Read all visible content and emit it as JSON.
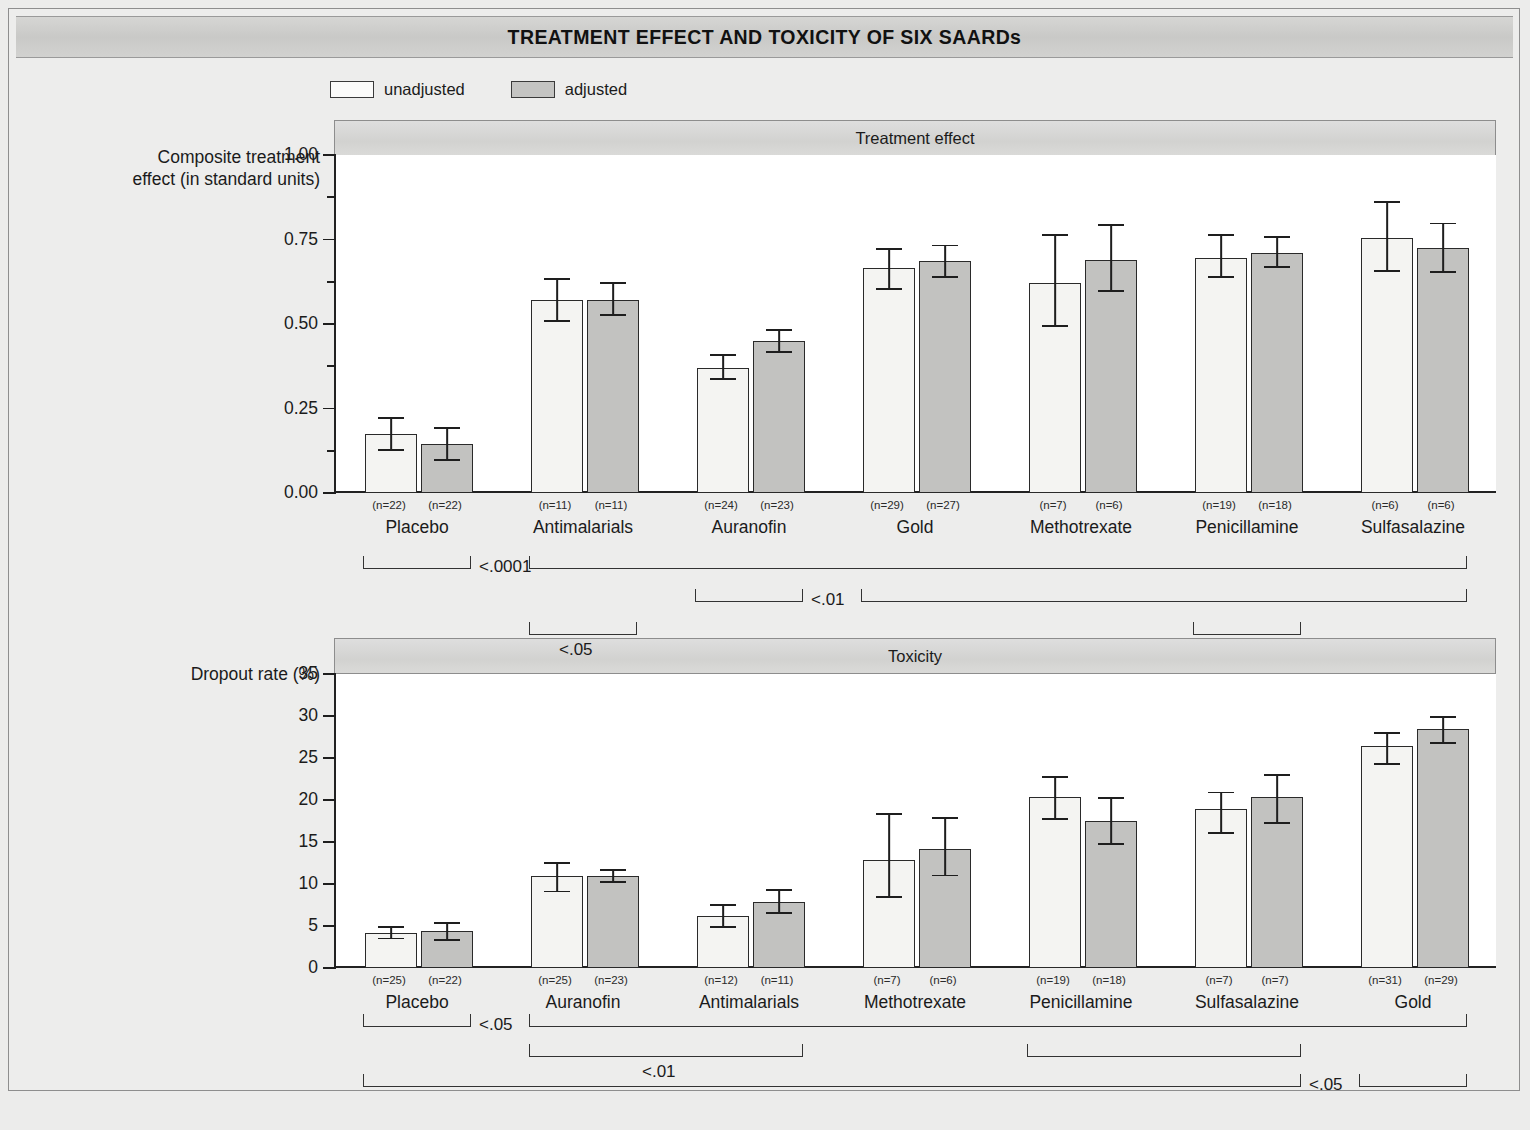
{
  "figure": {
    "title": "TREATMENT EFFECT AND TOXICITY OF SIX SAARDs",
    "caption": ""
  },
  "legend": {
    "items": [
      {
        "label": "unadjusted",
        "swatch": "white-bar-swatch",
        "color": "#f4f4f2"
      },
      {
        "label": "adjusted",
        "swatch": "gray-bar-swatch",
        "color": "#c2c2c0"
      }
    ]
  },
  "chart_data": [
    {
      "type": "bar",
      "id": "treatment-effect",
      "title": "Treatment effect",
      "ylabel": "Composite treatment effect (in standard units)",
      "xlabel": "",
      "ylim": [
        0.0,
        1.0
      ],
      "ytick_labels": [
        "0.00",
        "0.25",
        "0.50",
        "0.75",
        "1.00"
      ],
      "ytick_values": [
        0.0,
        0.25,
        0.5,
        0.75,
        1.0
      ],
      "yminor_values": [
        0.125,
        0.375,
        0.625,
        0.875
      ],
      "grid": false,
      "legend_position": "above-plot-left",
      "categories": [
        "Placebo",
        "Antimalarials",
        "Auranofin",
        "Gold",
        "Methotrexate",
        "Penicillamine",
        "Sulfasalazine"
      ],
      "series": [
        {
          "name": "unadjusted",
          "values": [
            0.175,
            0.57,
            0.37,
            0.665,
            0.62,
            0.695,
            0.755
          ],
          "err_low": [
            0.125,
            0.505,
            0.335,
            0.6,
            0.49,
            0.635,
            0.655
          ],
          "err_high": [
            0.225,
            0.635,
            0.41,
            0.725,
            0.765,
            0.765,
            0.865
          ],
          "n": [
            "(n=22)",
            "(n=11)",
            "(n=24)",
            "(n=29)",
            "(n=7)",
            "(n=19)",
            "(n=6)"
          ]
        },
        {
          "name": "adjusted",
          "values": [
            0.145,
            0.57,
            0.45,
            0.685,
            0.69,
            0.71,
            0.725
          ],
          "err_low": [
            0.095,
            0.525,
            0.415,
            0.635,
            0.595,
            0.665,
            0.65
          ],
          "err_high": [
            0.195,
            0.625,
            0.485,
            0.735,
            0.795,
            0.76,
            0.8
          ],
          "n": [
            "(n=22)",
            "(n=11)",
            "(n=23)",
            "(n=27)",
            "(n=6)",
            "(n=18)",
            "(n=6)"
          ]
        }
      ],
      "significance": [
        {
          "p": "<.0001",
          "from": "Placebo",
          "to": "Placebo",
          "row": 0,
          "label_side": "right"
        },
        {
          "p": "",
          "from": "Antimalarials",
          "to": "Sulfasalazine",
          "row": 0,
          "label_side": "none"
        },
        {
          "p": "<.01",
          "from": "Auranofin",
          "to": "Auranofin",
          "row": 1,
          "label_side": "right"
        },
        {
          "p": "",
          "from": "Gold",
          "to": "Sulfasalazine",
          "row": 1,
          "label_side": "none"
        },
        {
          "p": "<.05",
          "from": "Antimalarials",
          "to": "Antimalarials",
          "row": 2,
          "label_side": "none"
        },
        {
          "p": "",
          "from": "Penicillamine",
          "to": "Penicillamine",
          "row": 2,
          "label_side": "none"
        }
      ]
    },
    {
      "type": "bar",
      "id": "toxicity",
      "title": "Toxicity",
      "ylabel": "Dropout rate (%)",
      "xlabel": "",
      "ylim": [
        0,
        35
      ],
      "ytick_labels": [
        "0",
        "5",
        "10",
        "15",
        "20",
        "25",
        "30",
        "35"
      ],
      "ytick_values": [
        0,
        5,
        10,
        15,
        20,
        25,
        30,
        35
      ],
      "yminor_values": [],
      "grid": false,
      "legend_position": "above-plot-left",
      "categories": [
        "Placebo",
        "Auranofin",
        "Antimalarials",
        "Methotrexate",
        "Penicillamine",
        "Sulfasalazine",
        "Gold"
      ],
      "series": [
        {
          "name": "unadjusted",
          "values": [
            4.2,
            11.0,
            6.2,
            12.9,
            20.4,
            18.9,
            26.4
          ],
          "err_low": [
            3.4,
            9.0,
            4.8,
            8.3,
            17.6,
            16.0,
            24.2
          ],
          "err_high": [
            5.0,
            12.6,
            7.6,
            18.4,
            22.9,
            21.0,
            28.1
          ],
          "n": [
            "(n=25)",
            "(n=25)",
            "(n=12)",
            "(n=7)",
            "(n=19)",
            "(n=7)",
            "(n=31)"
          ]
        },
        {
          "name": "adjusted",
          "values": [
            4.4,
            10.9,
            7.9,
            14.2,
            17.5,
            20.3,
            28.5
          ],
          "err_low": [
            3.2,
            10.1,
            6.4,
            10.9,
            14.6,
            17.1,
            26.7
          ],
          "err_high": [
            5.5,
            11.8,
            9.4,
            18.0,
            20.3,
            23.1,
            30.0
          ],
          "n": [
            "(n=22)",
            "(n=23)",
            "(n=11)",
            "(n=6)",
            "(n=18)",
            "(n=7)",
            "(n=29)"
          ]
        }
      ],
      "significance": [
        {
          "p": "<.05",
          "from": "Placebo",
          "to": "Placebo",
          "row": 0,
          "label_side": "right"
        },
        {
          "p": "",
          "from": "Auranofin",
          "to": "Gold",
          "row": 0,
          "label_side": "none"
        },
        {
          "p": "<.01",
          "from": "Auranofin",
          "to": "Antimalarials",
          "row": 1,
          "label_side": "none"
        },
        {
          "p": "",
          "from": "Penicillamine",
          "to": "Sulfasalazine",
          "row": 1,
          "label_side": "none"
        },
        {
          "p": "<.05",
          "from": "Placebo",
          "to": "Sulfasalazine",
          "row": 2,
          "label_side": "right"
        },
        {
          "p": "",
          "from": "Gold",
          "to": "Gold",
          "row": 2,
          "label_side": "none"
        }
      ]
    }
  ],
  "panels": {
    "top": {
      "header": "Treatment effect",
      "axis_title_line1": "Composite treatment",
      "axis_title_line2": "effect (in standard units)"
    },
    "bottom": {
      "header": "Toxicity",
      "axis_title_line1": "Dropout rate (%)",
      "axis_title_line2": ""
    }
  }
}
